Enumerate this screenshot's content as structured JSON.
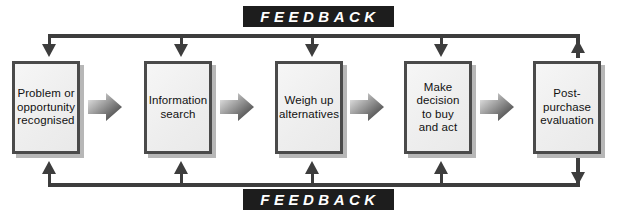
{
  "diagram": {
    "type": "flowchart",
    "colors": {
      "box_border": "#4a4a4a",
      "box_fill": "#eeeeee",
      "rail": "#3d3d3d",
      "plate_background": "#1d1d1d",
      "plate_text": "#ffffff",
      "page_background": "#ffffff"
    },
    "stages": [
      {
        "id": "stage-1",
        "label": "Problem or\nopportunity\nrecognised"
      },
      {
        "id": "stage-2",
        "label": "Information\nsearch"
      },
      {
        "id": "stage-3",
        "label": "Weigh up\nalternatives"
      },
      {
        "id": "stage-4",
        "label": "Make\ndecision\nto buy\nand act"
      },
      {
        "id": "stage-5",
        "label": "Post-\npurchase\nevaluation"
      }
    ],
    "connectors": [
      {
        "id": "chevron-1-2",
        "from": "stage-1",
        "to": "stage-2",
        "kind": "chevron-right"
      },
      {
        "id": "chevron-2-3",
        "from": "stage-2",
        "to": "stage-3",
        "kind": "chevron-right"
      },
      {
        "id": "chevron-3-4",
        "from": "stage-3",
        "to": "stage-4",
        "kind": "chevron-right"
      },
      {
        "id": "chevron-4-5",
        "from": "stage-4",
        "to": "stage-5",
        "kind": "chevron-right"
      }
    ],
    "feedback_loops": [
      {
        "id": "feedback-top",
        "label": "FEEDBACK",
        "position": "top",
        "source": "stage-5",
        "targets": [
          "stage-1",
          "stage-2",
          "stage-3",
          "stage-4"
        ],
        "direction": "right-to-left"
      },
      {
        "id": "feedback-bottom",
        "label": "FEEDBACK",
        "position": "bottom",
        "source": "stage-5",
        "targets": [
          "stage-1",
          "stage-2",
          "stage-3",
          "stage-4"
        ],
        "direction": "right-to-left"
      }
    ]
  }
}
